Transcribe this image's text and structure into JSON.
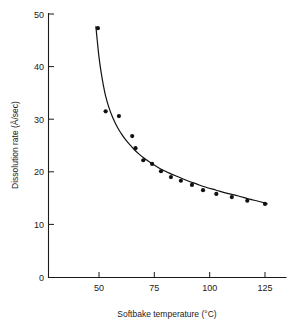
{
  "chart_data": {
    "type": "scatter",
    "title": "",
    "xlabel": "Softbake temperature (°C)",
    "ylabel": "Dissolution rate (Å/sec)",
    "xlim": [
      40,
      132
    ],
    "ylim": [
      0,
      50
    ],
    "xticks": [
      50,
      75,
      100,
      125
    ],
    "xtick_labels": [
      "50",
      "75",
      "100",
      "125"
    ],
    "yticks": [
      0,
      10,
      20,
      30,
      40,
      50
    ],
    "ytick_labels": [
      "0",
      "10",
      "20",
      "30",
      "40",
      "50"
    ],
    "grid": false,
    "legend": null,
    "series": [
      {
        "name": "Dissolution rate vs softbake temperature",
        "marker": "filled-circle",
        "marker_color": "#111111",
        "line_color": "#111111",
        "has_fitted_curve": true,
        "x": [
          49.5,
          53.0,
          59.0,
          65.0,
          66.5,
          70.0,
          74.0,
          78.0,
          82.5,
          87.0,
          92.0,
          97.0,
          103.0,
          110.0,
          117.0,
          125.0
        ],
        "y": [
          47.3,
          31.5,
          30.6,
          26.8,
          24.5,
          22.2,
          21.5,
          20.1,
          19.0,
          18.3,
          17.5,
          16.5,
          15.8,
          15.2,
          14.5,
          13.9
        ]
      }
    ],
    "fitted_curve": {
      "x": [
        48.6,
        49.2,
        50.0,
        51.0,
        52.0,
        53.0,
        54.5,
        56.0,
        58.0,
        60.0,
        62.0,
        64.0,
        66.0,
        68.0,
        70.0,
        73.0,
        76.0,
        79.0,
        82.0,
        86.0,
        90.0,
        94.0,
        98.0,
        103.0,
        108.0,
        113.0,
        118.0,
        122.0,
        126.0
      ],
      "y": [
        47.6,
        45.0,
        41.8,
        38.8,
        36.4,
        34.4,
        32.2,
        30.5,
        28.7,
        27.3,
        26.1,
        25.1,
        24.2,
        23.4,
        22.7,
        21.8,
        21.0,
        20.3,
        19.7,
        19.0,
        18.3,
        17.7,
        17.1,
        16.5,
        15.9,
        15.4,
        14.8,
        14.4,
        13.9
      ]
    }
  },
  "axes": {
    "y_axis_name": "dissolution-rate-axis",
    "x_axis_name": "softbake-temperature-axis"
  }
}
